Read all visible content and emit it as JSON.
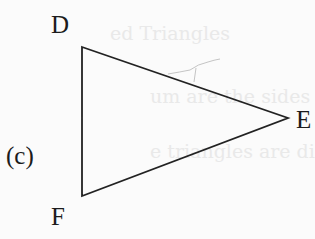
{
  "figure": {
    "part_label": "(c)",
    "vertices": [
      {
        "name": "D",
        "x": 82,
        "y": 47
      },
      {
        "name": "E",
        "x": 288,
        "y": 118
      },
      {
        "name": "F",
        "x": 82,
        "y": 196
      }
    ],
    "labels": {
      "D": "D",
      "E": "E",
      "F": "F"
    },
    "stroke_color": "#222222",
    "background": "#fbfbfb"
  },
  "bleed_through": {
    "line1": "ed Triangles",
    "line2": "um are the sides of",
    "line3": "e triangles are different"
  }
}
